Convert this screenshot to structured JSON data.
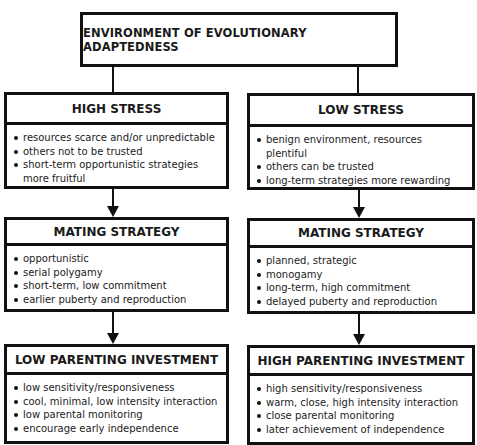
{
  "diagram": {
    "top": {
      "label": "ENVIRONMENT OF EVOLUTIONARY ADAPTEDNESS"
    },
    "left": {
      "stress": {
        "title": "HIGH STRESS",
        "items": [
          "resources scarce and/or unpredictable",
          "others not to be trusted",
          "short-term opportunistic strategies more fruitful"
        ]
      },
      "mating": {
        "title": "MATING STRATEGY",
        "items": [
          "opportunistic",
          "serial polygamy",
          "short-term, low commitment",
          "earlier puberty and reproduction"
        ]
      },
      "parenting": {
        "title": "LOW PARENTING INVESTMENT",
        "items": [
          "low sensitivity/responsiveness",
          "cool, minimal, low intensity interaction",
          "low parental monitoring",
          "encourage early independence"
        ]
      }
    },
    "right": {
      "stress": {
        "title": "LOW STRESS",
        "items": [
          "benign environment, resources plentiful",
          "others can be trusted",
          "long-term strategies more rewarding"
        ]
      },
      "mating": {
        "title": "MATING STRATEGY",
        "items": [
          "planned, strategic",
          "monogamy",
          "long-term, high commitment",
          "delayed puberty and reproduction"
        ]
      },
      "parenting": {
        "title": "HIGH PARENTING INVESTMENT",
        "items": [
          "high sensitivity/responsiveness",
          "warm, close, high intensity interaction",
          "close parental monitoring",
          "later achievement of independence"
        ]
      }
    }
  }
}
